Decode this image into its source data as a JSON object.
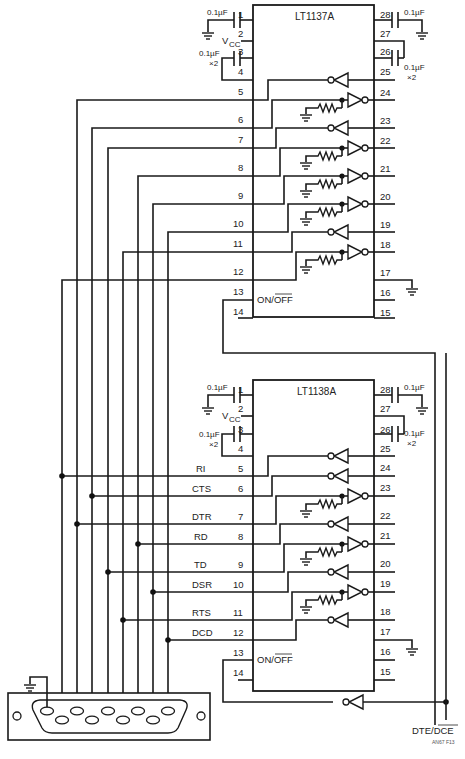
{
  "chips": [
    {
      "name": "LT1137A",
      "cap_pin1": "0.1µF",
      "cap_pin3": "0.1µF",
      "cap_pin3_mult": "×2",
      "cap_pin28": "0.1µF",
      "cap_pin26": "0.1µF",
      "cap_pin26_mult": "×2",
      "vcc": "V",
      "vcc_sub": "CC",
      "on_off": "ON/OFF",
      "left_pins": [
        "1",
        "2",
        "3",
        "4",
        "5",
        "6",
        "7",
        "8",
        "9",
        "10",
        "11",
        "12",
        "13",
        "14"
      ],
      "right_pins": [
        "28",
        "27",
        "26",
        "25",
        "24",
        "23",
        "22",
        "21",
        "20",
        "19",
        "18",
        "17",
        "16",
        "15"
      ]
    },
    {
      "name": "LT1138A",
      "cap_pin1": "0.1µF",
      "cap_pin3": "0.1µF",
      "cap_pin3_mult": "×2",
      "cap_pin28": "0.1µF",
      "cap_pin26": "0.1µF",
      "cap_pin26_mult": "×2",
      "vcc": "V",
      "vcc_sub": "CC",
      "on_off": "ON/OFF",
      "left_pins": [
        "1",
        "2",
        "3",
        "4",
        "5",
        "6",
        "7",
        "8",
        "9",
        "10",
        "11",
        "12",
        "13",
        "14"
      ],
      "right_pins": [
        "28",
        "27",
        "26",
        "25",
        "24",
        "23",
        "22",
        "21",
        "20",
        "19",
        "18",
        "17",
        "16",
        "15"
      ],
      "signals": [
        "RI",
        "CTS",
        "DTR",
        "RD",
        "TD",
        "DSR",
        "RTS",
        "DCD"
      ]
    }
  ],
  "dte_dce_label": "DTE/DCE",
  "figure_code": "AN67 F13",
  "connector": "DB9"
}
